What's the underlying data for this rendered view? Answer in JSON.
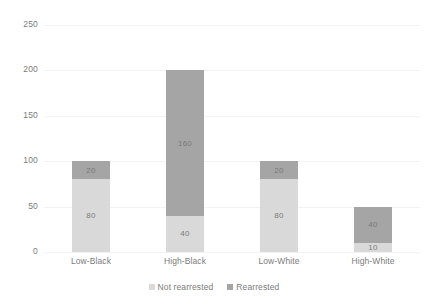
{
  "chart_data": {
    "type": "bar",
    "subtype": "stacked-bar",
    "title": "",
    "subtitle": "",
    "xlabel": "",
    "ylabel": "",
    "categories": [
      "Low-Black",
      "High-Black",
      "Low-White",
      "High-White"
    ],
    "series": [
      {
        "name": "Not rearrested",
        "color": "#d9d9d9",
        "values": [
          80,
          40,
          80,
          10
        ]
      },
      {
        "name": "Rearrested",
        "color": "#a5a5a5",
        "values": [
          20,
          160,
          20,
          40
        ]
      }
    ],
    "totals": [
      100,
      200,
      100,
      50
    ],
    "ylim": [
      0,
      250
    ],
    "yticks": [
      0,
      50,
      100,
      150,
      200,
      250
    ],
    "ytick_labels": [
      "0",
      "50",
      "100",
      "150",
      "200",
      "250"
    ],
    "grid": true,
    "legend_position": "bottom",
    "data_labels": [
      [
        "80",
        "40",
        "80",
        "10"
      ],
      [
        "20",
        "160",
        "20",
        "40"
      ]
    ]
  },
  "axes": {
    "y": {
      "ticks": [
        {
          "value": 250,
          "label": "250"
        },
        {
          "value": 200,
          "label": "200"
        },
        {
          "value": 150,
          "label": "150"
        },
        {
          "value": 100,
          "label": "100"
        },
        {
          "value": 50,
          "label": "50"
        },
        {
          "value": 0,
          "label": "0"
        }
      ]
    },
    "x": {
      "labels": [
        "Low-Black",
        "High-Black",
        "Low-White",
        "High-White"
      ]
    }
  },
  "legend": {
    "items": [
      {
        "label": "Not rearrested",
        "color": "#d9d9d9"
      },
      {
        "label": "Rearrested",
        "color": "#a5a5a5"
      }
    ]
  },
  "colors": {
    "not_rearrested": "#d9d9d9",
    "rearrested": "#a5a5a5",
    "text": "#7b7b7b",
    "gridline": "#f2f2f2",
    "background": "#ffffff"
  }
}
